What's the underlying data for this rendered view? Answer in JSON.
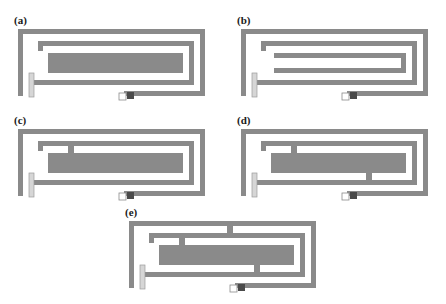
{
  "figure": {
    "type": "technical-diagram",
    "background_color": "#ffffff",
    "trace_color": "#8a8a8a",
    "trace_dark_color": "#6f6f6f",
    "feed_pad_color": "#4a4a4a",
    "outline_color": "#b5b5b5",
    "panel_count": 5
  },
  "panels": [
    {
      "id": "a",
      "label": "(a)",
      "description": "Two-turn rectangular spiral with plain inner arm, no shorting stubs",
      "stub_count": 0
    },
    {
      "id": "b",
      "label": "(b)",
      "description": "Two-turn rectangular spiral with shortened inner arm, no stubs",
      "stub_count": 0
    },
    {
      "id": "c",
      "label": "(c)",
      "description": "Two-turn rectangular spiral with one shorting stub on inner arm",
      "stub_count": 1
    },
    {
      "id": "d",
      "label": "(d)",
      "description": "Two-turn rectangular spiral with two shorting stubs on inner arm",
      "stub_count": 2
    },
    {
      "id": "e",
      "label": "(e)",
      "description": "Two-turn rectangular spiral with three shorting stubs including outer ring stub",
      "stub_count": 3
    }
  ],
  "layout": {
    "a": {
      "x": 12,
      "y": 12,
      "label_x": 12,
      "label_y": 14
    },
    "b": {
      "x": 235,
      "y": 12,
      "label_x": 236,
      "label_y": 14
    },
    "c": {
      "x": 12,
      "y": 112,
      "label_x": 12,
      "label_y": 114
    },
    "d": {
      "x": 235,
      "y": 112,
      "label_x": 236,
      "label_y": 114
    },
    "e": {
      "x": 123,
      "y": 204,
      "label_x": 124,
      "label_y": 206
    }
  }
}
